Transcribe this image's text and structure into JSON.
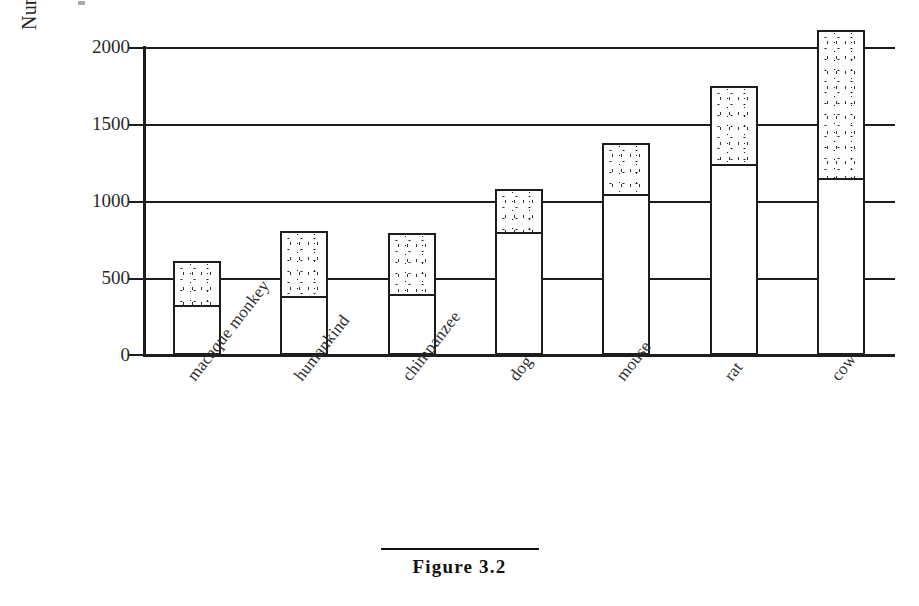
{
  "figure": {
    "caption": "Figure 3.2",
    "number": "3.2"
  },
  "chart_data": {
    "type": "bar",
    "subtype": "stacked-bar",
    "title": "",
    "xlabel": "",
    "ylabel": "Number of olfactory genes",
    "ylim": [
      0,
      2000
    ],
    "yticks": [
      0,
      500,
      1000,
      1500,
      2000
    ],
    "ytick_labels": [
      "0",
      "500",
      "1000",
      "1500",
      "2000"
    ],
    "grid": true,
    "grid_axis": "y",
    "legend": "none",
    "legend_position": "none",
    "categories": [
      "macaque monkey",
      "humankind",
      "chimpanzee",
      "dog",
      "mouse",
      "rat",
      "cow"
    ],
    "series": [
      {
        "name": "functional genes",
        "fill": "white",
        "values": [
          325,
          380,
          395,
          800,
          1045,
          1240,
          1150
        ]
      },
      {
        "name": "pseudogenes",
        "fill": "stippled",
        "values": [
          285,
          425,
          400,
          280,
          330,
          505,
          960
        ]
      }
    ],
    "totals": [
      610,
      805,
      795,
      1080,
      1375,
      1745,
      2110
    ],
    "annotations": []
  },
  "axis": {
    "ytitle": "Number of olfactory genes",
    "ticks": [
      {
        "label": "2000",
        "value": 2000
      },
      {
        "label": "1500",
        "value": 1500
      },
      {
        "label": "1000",
        "value": 1000
      },
      {
        "label": "500",
        "value": 500
      },
      {
        "label": "0",
        "value": 0
      }
    ]
  },
  "colors": {
    "ink": "#1d1d1d",
    "background": "#ffffff",
    "stipple_dot": "#222222",
    "bar_fill": "#ffffff"
  }
}
